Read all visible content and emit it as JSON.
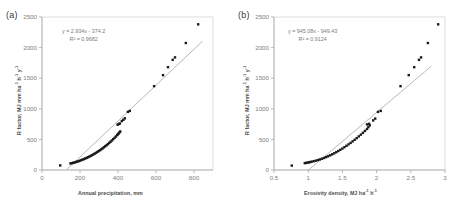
{
  "figure": {
    "background": "#ffffff",
    "panels": [
      {
        "label": "(a)",
        "equation_line1": "y = 2.934x - 374.2",
        "equation_line2": "R² = 0.9682",
        "xlabel": "Annual precipitation, mm",
        "ylabel_text": "R factor, MJ mm ha h  y",
        "ylabel_html": "R factor, MJ mm ha<sup>-1</sup> h<sup>-1</sup> y<sup>-1</sup>",
        "xlabel_html": "Annual precipitation, mm"
      },
      {
        "label": "(b)",
        "equation_line1": "y = 945.08x - 949.43",
        "equation_line2": "R² = 0.9124",
        "xlabel": "Erosivity density, MJ ha h",
        "ylabel_text": "R factor, MJ mm ha h  y",
        "ylabel_html": "R factor, MJ mm ha<sup>-1</sup> h<sup>-1</sup> y<sup>-1</sup>",
        "xlabel_html": "Erosivity density, MJ ha<sup>-1</sup> h<sup>-1</sup>"
      }
    ]
  },
  "chart_data": [
    {
      "type": "scatter",
      "panel": "(a)",
      "title": "",
      "xlabel": "Annual precipitation, mm",
      "ylabel": "R factor, MJ mm ha-1 h-1 y-1",
      "xlim": [
        0,
        900
      ],
      "ylim": [
        0,
        2500
      ],
      "xticks": [
        0,
        200,
        400,
        600,
        800
      ],
      "yticks": [
        0,
        500,
        1000,
        1500,
        2000,
        2500
      ],
      "grid": false,
      "legend": "none",
      "annotations": [
        "y = 2.934x - 374.2",
        "R² = 0.9682"
      ],
      "fit_line": {
        "type": "linear",
        "slope": 2.934,
        "intercept": -374.2,
        "r_squared": 0.9682,
        "x_start": 130,
        "x_end": 845,
        "color": "#9a9a9a"
      },
      "marker_color": "#1a1a1a",
      "points": [
        {
          "x": 96,
          "y": 75
        },
        {
          "x": 150,
          "y": 108
        },
        {
          "x": 158,
          "y": 112
        },
        {
          "x": 165,
          "y": 118
        },
        {
          "x": 172,
          "y": 124
        },
        {
          "x": 179,
          "y": 131
        },
        {
          "x": 186,
          "y": 138
        },
        {
          "x": 193,
          "y": 145
        },
        {
          "x": 200,
          "y": 153
        },
        {
          "x": 207,
          "y": 161
        },
        {
          "x": 214,
          "y": 170
        },
        {
          "x": 221,
          "y": 179
        },
        {
          "x": 228,
          "y": 188
        },
        {
          "x": 235,
          "y": 198
        },
        {
          "x": 242,
          "y": 208
        },
        {
          "x": 249,
          "y": 219
        },
        {
          "x": 256,
          "y": 230
        },
        {
          "x": 263,
          "y": 242
        },
        {
          "x": 270,
          "y": 254
        },
        {
          "x": 277,
          "y": 267
        },
        {
          "x": 284,
          "y": 280
        },
        {
          "x": 291,
          "y": 294
        },
        {
          "x": 298,
          "y": 308
        },
        {
          "x": 305,
          "y": 323
        },
        {
          "x": 312,
          "y": 338
        },
        {
          "x": 319,
          "y": 354
        },
        {
          "x": 326,
          "y": 371
        },
        {
          "x": 333,
          "y": 388
        },
        {
          "x": 340,
          "y": 406
        },
        {
          "x": 347,
          "y": 424
        },
        {
          "x": 354,
          "y": 443
        },
        {
          "x": 361,
          "y": 463
        },
        {
          "x": 368,
          "y": 483
        },
        {
          "x": 375,
          "y": 504
        },
        {
          "x": 382,
          "y": 526
        },
        {
          "x": 389,
          "y": 548
        },
        {
          "x": 396,
          "y": 571
        },
        {
          "x": 400,
          "y": 585
        },
        {
          "x": 404,
          "y": 600
        },
        {
          "x": 408,
          "y": 615
        },
        {
          "x": 412,
          "y": 630
        },
        {
          "x": 398,
          "y": 740
        },
        {
          "x": 404,
          "y": 752
        },
        {
          "x": 410,
          "y": 760
        },
        {
          "x": 420,
          "y": 800
        },
        {
          "x": 428,
          "y": 820
        },
        {
          "x": 436,
          "y": 845
        },
        {
          "x": 452,
          "y": 950
        },
        {
          "x": 462,
          "y": 965
        },
        {
          "x": 590,
          "y": 1370
        },
        {
          "x": 637,
          "y": 1550
        },
        {
          "x": 663,
          "y": 1680
        },
        {
          "x": 688,
          "y": 1800
        },
        {
          "x": 700,
          "y": 1840
        },
        {
          "x": 757,
          "y": 2075
        },
        {
          "x": 822,
          "y": 2380
        }
      ]
    },
    {
      "type": "scatter",
      "panel": "(b)",
      "title": "",
      "xlabel": "Erosivity density, MJ ha-1 h-1",
      "ylabel": "R factor, MJ mm ha-1 h-1 y-1",
      "xlim": [
        0.5,
        3.0
      ],
      "ylim": [
        0,
        2500
      ],
      "xticks": [
        0.5,
        1,
        1.5,
        2,
        2.5,
        3
      ],
      "yticks": [
        0,
        500,
        1000,
        1500,
        2000,
        2500
      ],
      "grid": false,
      "legend": "none",
      "annotations": [
        "y = 945.08x - 949.43",
        "R² = 0.9124"
      ],
      "fit_line": {
        "type": "linear",
        "slope": 945.08,
        "intercept": -949.43,
        "r_squared": 0.9124,
        "x_start": 1.0,
        "x_end": 2.8,
        "color": "#9a9a9a"
      },
      "marker_color": "#1a1a1a",
      "points": [
        {
          "x": 0.76,
          "y": 72
        },
        {
          "x": 0.95,
          "y": 112
        },
        {
          "x": 0.97,
          "y": 116
        },
        {
          "x": 0.99,
          "y": 120
        },
        {
          "x": 1.01,
          "y": 125
        },
        {
          "x": 1.03,
          "y": 130
        },
        {
          "x": 1.05,
          "y": 136
        },
        {
          "x": 1.08,
          "y": 143
        },
        {
          "x": 1.11,
          "y": 152
        },
        {
          "x": 1.14,
          "y": 162
        },
        {
          "x": 1.17,
          "y": 172
        },
        {
          "x": 1.2,
          "y": 184
        },
        {
          "x": 1.23,
          "y": 196
        },
        {
          "x": 1.26,
          "y": 210
        },
        {
          "x": 1.29,
          "y": 224
        },
        {
          "x": 1.32,
          "y": 240
        },
        {
          "x": 1.35,
          "y": 256
        },
        {
          "x": 1.38,
          "y": 273
        },
        {
          "x": 1.41,
          "y": 291
        },
        {
          "x": 1.44,
          "y": 310
        },
        {
          "x": 1.47,
          "y": 330
        },
        {
          "x": 1.5,
          "y": 351
        },
        {
          "x": 1.53,
          "y": 373
        },
        {
          "x": 1.56,
          "y": 396
        },
        {
          "x": 1.59,
          "y": 419
        },
        {
          "x": 1.62,
          "y": 443
        },
        {
          "x": 1.65,
          "y": 468
        },
        {
          "x": 1.68,
          "y": 494
        },
        {
          "x": 1.71,
          "y": 521
        },
        {
          "x": 1.74,
          "y": 549
        },
        {
          "x": 1.77,
          "y": 578
        },
        {
          "x": 1.8,
          "y": 608
        },
        {
          "x": 1.83,
          "y": 639
        },
        {
          "x": 1.86,
          "y": 671
        },
        {
          "x": 1.88,
          "y": 700
        },
        {
          "x": 1.9,
          "y": 730
        },
        {
          "x": 1.86,
          "y": 745
        },
        {
          "x": 1.89,
          "y": 755
        },
        {
          "x": 1.95,
          "y": 810
        },
        {
          "x": 1.98,
          "y": 840
        },
        {
          "x": 2.02,
          "y": 950
        },
        {
          "x": 2.06,
          "y": 965
        },
        {
          "x": 2.35,
          "y": 1370
        },
        {
          "x": 2.47,
          "y": 1550
        },
        {
          "x": 2.55,
          "y": 1680
        },
        {
          "x": 2.62,
          "y": 1800
        },
        {
          "x": 2.65,
          "y": 1840
        },
        {
          "x": 2.75,
          "y": 2075
        },
        {
          "x": 2.9,
          "y": 2380
        }
      ]
    }
  ]
}
